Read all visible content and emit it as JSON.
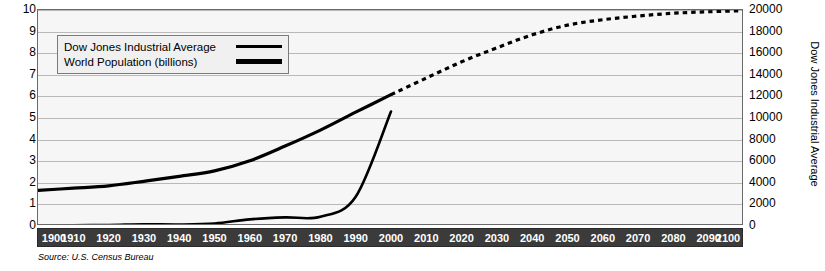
{
  "chart_data": {
    "type": "line",
    "title": "",
    "source": "Source: U.S. Census Bureau",
    "xlabel": "",
    "xlim": [
      1900,
      2100
    ],
    "x_ticks": [
      1900,
      1910,
      1920,
      1930,
      1940,
      1950,
      1960,
      1970,
      1980,
      1990,
      2000,
      2010,
      2020,
      2030,
      2040,
      2050,
      2060,
      2070,
      2080,
      2090,
      2100
    ],
    "grid": true,
    "legend_position": "upper-left-inside",
    "axes": [
      {
        "id": "left",
        "label": "World Population (billions)",
        "lim": [
          0,
          10
        ],
        "ticks": [
          0,
          1,
          2,
          3,
          4,
          5,
          6,
          7,
          8,
          9,
          10
        ],
        "tick_labels": [
          "0",
          "1",
          "2",
          "3",
          "4",
          "5",
          "6",
          "7",
          "8",
          "9",
          "10"
        ]
      },
      {
        "id": "right",
        "label": "Dow Jones Industrial Average",
        "lim": [
          0,
          20000
        ],
        "ticks": [
          0,
          2000,
          4000,
          6000,
          8000,
          10000,
          12000,
          14000,
          16000,
          18000,
          20000
        ],
        "tick_labels": [
          "0",
          "2000",
          "4000",
          "6000",
          "8000",
          "10000",
          "12000",
          "14000",
          "16000",
          "18000",
          "20000"
        ]
      }
    ],
    "series": [
      {
        "name": "World Population (billions)",
        "axis": "left",
        "style": "solid",
        "color": "#000000",
        "width": 3.2,
        "x": [
          1900,
          1910,
          1920,
          1930,
          1940,
          1950,
          1960,
          1970,
          1980,
          1990,
          2000
        ],
        "values": [
          1.65,
          1.75,
          1.86,
          2.07,
          2.3,
          2.55,
          3.02,
          3.7,
          4.44,
          5.27,
          6.08
        ]
      },
      {
        "name": "World Population (billions) projected",
        "axis": "left",
        "style": "dotted",
        "color": "#000000",
        "width": 3.2,
        "x": [
          2000,
          2010,
          2020,
          2030,
          2040,
          2050,
          2060,
          2070,
          2080,
          2090,
          2100
        ],
        "values": [
          6.08,
          6.85,
          7.6,
          8.25,
          8.85,
          9.3,
          9.55,
          9.72,
          9.85,
          9.92,
          9.97
        ]
      },
      {
        "name": "Dow Jones Industrial Average",
        "axis": "right",
        "style": "solid",
        "color": "#000000",
        "width": 2.6,
        "x": [
          1900,
          1910,
          1920,
          1930,
          1940,
          1950,
          1960,
          1970,
          1980,
          1990,
          2000
        ],
        "values": [
          60,
          75,
          90,
          160,
          140,
          235,
          615,
          800,
          860,
          2700,
          10600
        ]
      }
    ]
  },
  "legend": {
    "items": [
      {
        "label": "Dow Jones Industrial Average",
        "swatch": "thin-line"
      },
      {
        "label": "World Population (billions)",
        "swatch": "thick-line"
      }
    ]
  }
}
